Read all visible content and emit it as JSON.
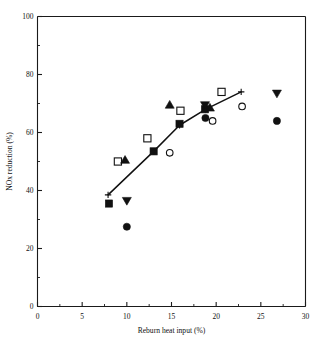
{
  "chart_data": {
    "type": "scatter",
    "title": "",
    "xlabel": "Reburn heat input (%)",
    "ylabel": "NOx reduction (%)",
    "xlim": [
      0,
      30
    ],
    "ylim": [
      0,
      100
    ],
    "xticks": [
      0,
      5,
      10,
      15,
      20,
      25,
      30
    ],
    "xtick_labels": [
      "0",
      "5",
      "10",
      "15",
      "20",
      "25",
      "30"
    ],
    "yticks": [
      0,
      20,
      40,
      60,
      80,
      100
    ],
    "ytick_labels": [
      "0",
      "20",
      "40",
      "60",
      "80",
      "100"
    ],
    "x_minor_ticks": [
      2.5,
      7.5,
      12.5,
      17.5,
      22.5,
      27.5
    ],
    "y_minor_ticks": [
      10,
      30,
      50,
      70,
      90
    ],
    "grid": false,
    "legend": null,
    "legend_position": "none",
    "series": [
      {
        "name": "filled-square",
        "marker": "filled-square",
        "points": [
          {
            "x": 8.0,
            "y": 35.5
          },
          {
            "x": 13.0,
            "y": 53.5
          },
          {
            "x": 15.9,
            "y": 63.0
          },
          {
            "x": 18.75,
            "y": 68.0
          }
        ]
      },
      {
        "name": "open-square",
        "marker": "open-square",
        "points": [
          {
            "x": 9.0,
            "y": 50.0
          },
          {
            "x": 12.3,
            "y": 58.0
          },
          {
            "x": 16.0,
            "y": 67.5
          },
          {
            "x": 20.6,
            "y": 74.0
          }
        ]
      },
      {
        "name": "filled-circle",
        "marker": "filled-circle",
        "points": [
          {
            "x": 10.0,
            "y": 27.5
          },
          {
            "x": 18.8,
            "y": 65.0
          },
          {
            "x": 26.8,
            "y": 64.0
          }
        ]
      },
      {
        "name": "open-circle",
        "marker": "open-circle",
        "points": [
          {
            "x": 14.8,
            "y": 53.0
          },
          {
            "x": 19.6,
            "y": 64.0
          },
          {
            "x": 22.9,
            "y": 69.0
          }
        ]
      },
      {
        "name": "filled-up-triangle",
        "marker": "filled-up-triangle",
        "points": [
          {
            "x": 9.8,
            "y": 50.5
          },
          {
            "x": 14.8,
            "y": 69.5
          },
          {
            "x": 19.3,
            "y": 68.5
          }
        ]
      },
      {
        "name": "filled-down-triangle",
        "marker": "filled-down-triangle",
        "points": [
          {
            "x": 10.0,
            "y": 36.5
          },
          {
            "x": 18.75,
            "y": 69.5
          },
          {
            "x": 26.8,
            "y": 73.5
          }
        ]
      },
      {
        "name": "plus-trend",
        "marker": "plus",
        "points": [
          {
            "x": 7.9,
            "y": 38.5
          },
          {
            "x": 13.0,
            "y": 53.5
          },
          {
            "x": 15.9,
            "y": 62.5
          },
          {
            "x": 18.8,
            "y": 68.0
          },
          {
            "x": 22.8,
            "y": 74.0
          }
        ]
      }
    ],
    "trend_line": {
      "name": "fitted-curve",
      "points": [
        {
          "x": 7.9,
          "y": 38.5
        },
        {
          "x": 13.0,
          "y": 53.5
        },
        {
          "x": 15.9,
          "y": 62.5
        },
        {
          "x": 18.8,
          "y": 68.0
        },
        {
          "x": 22.8,
          "y": 74.0
        }
      ]
    }
  }
}
